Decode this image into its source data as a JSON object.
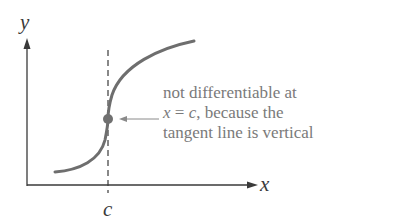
{
  "diagram": {
    "y_axis_label": "y",
    "x_axis_label": "x",
    "point_label": "c",
    "annotation": {
      "line1": "not differentiable at",
      "line2_var": "x",
      "line2_eq": " = ",
      "line2_c": "c",
      "line2_rest": ", because the",
      "line3": "tangent line is vertical"
    },
    "colors": {
      "curve": "#6e6e6e",
      "axes": "#3a3a3a",
      "point": "#707070",
      "annotation_text": "#7a7a7a"
    }
  }
}
